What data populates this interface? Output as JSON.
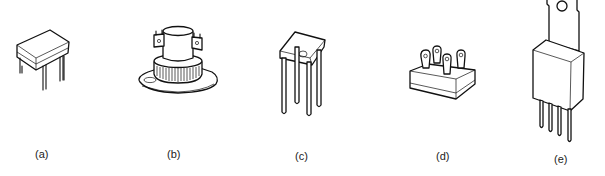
{
  "figure": {
    "parts": [
      {
        "id": "a",
        "label": "(a)",
        "shape": "dual-in-line package with four pins"
      },
      {
        "id": "b",
        "label": "(b)",
        "shape": "stud-mount package on flange with two solder lug terminals"
      },
      {
        "id": "c",
        "label": "(c)",
        "shape": "square body with four long leads and index dot"
      },
      {
        "id": "d",
        "label": "(d)",
        "shape": "square block module with four tab terminals"
      },
      {
        "id": "e",
        "label": "(e)",
        "shape": "TO-220 style body with mounting tab and four pins"
      }
    ]
  }
}
